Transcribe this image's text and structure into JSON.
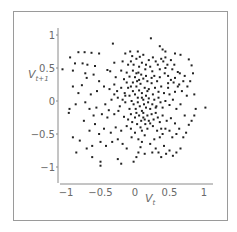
{
  "chart_data": {
    "type": "scatter",
    "title": "",
    "xlabel": "V_t",
    "ylabel": "V_{t+1}",
    "xlabel_main": "V",
    "xlabel_sub": "t",
    "ylabel_main": "V",
    "ylabel_sub": "t+1",
    "xlim": [
      -1.1,
      1.1
    ],
    "ylim": [
      -1.05,
      1.05
    ],
    "x_ticks": [
      -1,
      -0.5,
      0,
      0.5,
      1
    ],
    "y_ticks": [
      -1,
      -0.5,
      0,
      0.5,
      1
    ],
    "x_tick_labels": [
      "−1",
      "−0.5",
      "0",
      "0.5",
      "1"
    ],
    "y_tick_labels": [
      "−1",
      "−0.5",
      "0",
      "0.5",
      "1"
    ],
    "grid": false,
    "legend": null,
    "marker_color": "#222222",
    "axis_color": "#8a8a8a",
    "points": [
      [
        -0.94,
        0.66
      ],
      [
        -0.82,
        0.74
      ],
      [
        -0.73,
        0.74
      ],
      [
        -0.63,
        0.73
      ],
      [
        -0.52,
        0.72
      ],
      [
        -0.87,
        0.57
      ],
      [
        -0.76,
        0.57
      ],
      [
        -0.9,
        0.46
      ],
      [
        -0.69,
        0.55
      ],
      [
        -0.58,
        0.53
      ],
      [
        -0.32,
        0.87
      ],
      [
        -0.3,
        0.58
      ],
      [
        -0.36,
        0.45
      ],
      [
        -0.14,
        0.72
      ],
      [
        -0.07,
        0.75
      ],
      [
        -0.06,
        0.6
      ],
      [
        -0.02,
        0.55
      ],
      [
        0.04,
        0.75
      ],
      [
        0.07,
        0.67
      ],
      [
        0.12,
        0.7
      ],
      [
        -1.05,
        0.48
      ],
      [
        -0.72,
        0.42
      ],
      [
        -0.7,
        0.35
      ],
      [
        -0.77,
        0.24
      ],
      [
        -0.6,
        0.4
      ],
      [
        -0.52,
        0.3
      ],
      [
        -0.4,
        0.47
      ],
      [
        -0.28,
        0.36
      ],
      [
        -0.2,
        0.46
      ],
      [
        -0.16,
        0.33
      ],
      [
        -0.12,
        0.43
      ],
      [
        -0.08,
        0.37
      ],
      [
        -0.03,
        0.46
      ],
      [
        0.0,
        0.36
      ],
      [
        0.03,
        0.3
      ],
      [
        0.05,
        0.43
      ],
      [
        0.09,
        0.4
      ],
      [
        0.12,
        0.34
      ],
      [
        0.15,
        0.48
      ],
      [
        0.18,
        0.3
      ],
      [
        0.22,
        0.52
      ],
      [
        0.25,
        0.45
      ],
      [
        0.28,
        0.38
      ],
      [
        0.33,
        0.55
      ],
      [
        0.38,
        0.64
      ],
      [
        0.41,
        0.6
      ],
      [
        0.44,
        0.66
      ],
      [
        0.47,
        0.55
      ],
      [
        0.52,
        0.62
      ],
      [
        0.57,
        0.55
      ],
      [
        0.36,
        0.83
      ],
      [
        0.4,
        0.78
      ],
      [
        0.44,
        0.75
      ],
      [
        0.58,
        0.72
      ],
      [
        0.66,
        0.7
      ],
      [
        0.78,
        0.63
      ],
      [
        0.82,
        0.54
      ],
      [
        0.23,
        0.95
      ],
      [
        0.65,
        0.42
      ],
      [
        0.72,
        0.38
      ],
      [
        0.62,
        0.44
      ],
      [
        0.54,
        0.48
      ],
      [
        0.48,
        0.38
      ],
      [
        0.43,
        0.42
      ],
      [
        0.36,
        0.36
      ],
      [
        0.32,
        0.3
      ],
      [
        0.24,
        0.27
      ],
      [
        0.29,
        0.2
      ],
      [
        0.38,
        0.22
      ],
      [
        0.48,
        0.27
      ],
      [
        0.56,
        0.28
      ],
      [
        0.64,
        0.25
      ],
      [
        0.68,
        0.15
      ],
      [
        0.58,
        0.14
      ],
      [
        0.5,
        0.1
      ],
      [
        0.42,
        0.12
      ],
      [
        0.34,
        0.14
      ],
      [
        0.26,
        0.1
      ],
      [
        0.75,
        0.08
      ],
      [
        0.86,
        0.1
      ],
      [
        -0.95,
        -0.12
      ],
      [
        -0.96,
        -0.18
      ],
      [
        -0.86,
        -0.05
      ],
      [
        -0.72,
        -0.02
      ],
      [
        -0.64,
        0.1
      ],
      [
        -0.55,
        0.15
      ],
      [
        -0.45,
        0.22
      ],
      [
        -0.37,
        0.18
      ],
      [
        -0.3,
        0.1
      ],
      [
        -0.43,
        -0.05
      ],
      [
        -0.38,
        -0.14
      ],
      [
        -0.3,
        -0.2
      ],
      [
        -0.22,
        -0.08
      ],
      [
        -0.18,
        0.02
      ],
      [
        -0.15,
        0.12
      ],
      [
        -0.1,
        0.2
      ],
      [
        -0.08,
        0.08
      ],
      [
        -0.05,
        0.0
      ],
      [
        -0.03,
        0.15
      ],
      [
        0.0,
        0.1
      ],
      [
        0.02,
        0.22
      ],
      [
        0.04,
        0.05
      ],
      [
        0.06,
        0.16
      ],
      [
        0.08,
        0.26
      ],
      [
        0.1,
        0.12
      ],
      [
        0.12,
        0.02
      ],
      [
        0.14,
        0.2
      ],
      [
        0.16,
        0.08
      ],
      [
        0.18,
        0.15
      ],
      [
        0.2,
        0.04
      ],
      [
        -0.02,
        -0.05
      ],
      [
        0.01,
        -0.12
      ],
      [
        0.04,
        -0.02
      ],
      [
        0.07,
        -0.08
      ],
      [
        0.1,
        -0.15
      ],
      [
        0.13,
        -0.05
      ],
      [
        0.16,
        -0.1
      ],
      [
        0.19,
        -0.02
      ],
      [
        0.22,
        -0.12
      ],
      [
        0.25,
        -0.05
      ],
      [
        0.28,
        0.02
      ],
      [
        0.31,
        -0.08
      ],
      [
        0.34,
        0.05
      ],
      [
        0.37,
        -0.02
      ],
      [
        0.4,
        -0.1
      ],
      [
        0.44,
        0.0
      ],
      [
        0.5,
        -0.06
      ],
      [
        0.55,
        0.02
      ],
      [
        0.6,
        -0.12
      ],
      [
        0.66,
        -0.05
      ],
      [
        -0.06,
        -0.2
      ],
      [
        -0.1,
        -0.28
      ],
      [
        -0.04,
        -0.32
      ],
      [
        0.0,
        -0.25
      ],
      [
        0.03,
        -0.35
      ],
      [
        0.06,
        -0.22
      ],
      [
        0.09,
        -0.3
      ],
      [
        0.12,
        -0.25
      ],
      [
        0.15,
        -0.35
      ],
      [
        0.18,
        -0.22
      ],
      [
        0.2,
        -0.3
      ],
      [
        0.24,
        -0.2
      ],
      [
        0.27,
        -0.28
      ],
      [
        0.3,
        -0.18
      ],
      [
        0.33,
        -0.25
      ],
      [
        0.36,
        -0.32
      ],
      [
        0.4,
        -0.22
      ],
      [
        0.46,
        -0.3
      ],
      [
        0.52,
        -0.26
      ],
      [
        0.58,
        -0.34
      ],
      [
        -0.14,
        -0.02
      ],
      [
        -0.12,
        0.28
      ],
      [
        -0.2,
        0.2
      ],
      [
        -0.25,
        0.05
      ],
      [
        -0.24,
        -0.15
      ],
      [
        -0.16,
        -0.24
      ],
      [
        -0.12,
        -0.38
      ],
      [
        -0.2,
        -0.45
      ],
      [
        -0.28,
        -0.4
      ],
      [
        -0.35,
        -0.48
      ],
      [
        -0.45,
        -0.42
      ],
      [
        -0.52,
        -0.5
      ],
      [
        -0.58,
        -0.35
      ],
      [
        -0.66,
        -0.45
      ],
      [
        -0.74,
        -0.3
      ],
      [
        -0.8,
        -0.6
      ],
      [
        -0.7,
        -0.72
      ],
      [
        -0.62,
        -0.68
      ],
      [
        -0.5,
        -0.62
      ],
      [
        -0.42,
        -0.68
      ],
      [
        -0.33,
        -0.62
      ],
      [
        -0.25,
        -0.58
      ],
      [
        -0.18,
        -0.65
      ],
      [
        -0.12,
        -0.72
      ],
      [
        -0.05,
        -0.55
      ],
      [
        0.0,
        -0.48
      ],
      [
        0.05,
        -0.58
      ],
      [
        0.1,
        -0.45
      ],
      [
        0.14,
        -0.52
      ],
      [
        0.1,
        -0.62
      ],
      [
        -0.9,
        -0.55
      ],
      [
        -0.85,
        -0.78
      ],
      [
        -0.62,
        -0.85
      ],
      [
        -0.5,
        -0.92
      ],
      [
        -0.5,
        -0.98
      ],
      [
        -0.2,
        -0.95
      ],
      [
        -0.25,
        -0.88
      ],
      [
        0.02,
        -0.85
      ],
      [
        0.05,
        -0.78
      ],
      [
        -0.02,
        -0.92
      ],
      [
        0.08,
        -0.7
      ],
      [
        0.14,
        -0.8
      ],
      [
        0.22,
        -0.65
      ],
      [
        0.28,
        -0.58
      ],
      [
        0.32,
        -0.45
      ],
      [
        0.36,
        -0.55
      ],
      [
        0.4,
        -0.5
      ],
      [
        0.44,
        -0.42
      ],
      [
        0.5,
        -0.45
      ],
      [
        0.54,
        -0.55
      ],
      [
        0.6,
        -0.5
      ],
      [
        0.64,
        -0.42
      ],
      [
        0.7,
        -0.55
      ],
      [
        0.74,
        -0.48
      ],
      [
        0.78,
        -0.36
      ],
      [
        0.82,
        -0.3
      ],
      [
        0.86,
        -0.22
      ],
      [
        0.88,
        -0.12
      ],
      [
        1.02,
        -0.1
      ],
      [
        0.72,
        -0.22
      ],
      [
        0.3,
        -0.72
      ],
      [
        0.34,
        -0.78
      ],
      [
        0.38,
        -0.85
      ],
      [
        0.45,
        -0.8
      ],
      [
        0.5,
        -0.75
      ],
      [
        0.55,
        -0.83
      ],
      [
        0.6,
        -0.78
      ],
      [
        0.42,
        -0.68
      ],
      [
        0.66,
        -0.72
      ],
      [
        0.25,
        -0.78
      ],
      [
        -0.3,
        0.25
      ],
      [
        -0.26,
        0.15
      ],
      [
        -0.34,
        0.02
      ],
      [
        -0.4,
        -0.25
      ],
      [
        -0.48,
        -0.2
      ],
      [
        -0.56,
        -0.1
      ],
      [
        -0.6,
        -0.22
      ],
      [
        -0.66,
        -0.12
      ],
      [
        -0.82,
        0.12
      ],
      [
        -0.9,
        0.22
      ],
      [
        0.06,
        0.52
      ],
      [
        0.1,
        0.58
      ],
      [
        0.16,
        0.55
      ],
      [
        0.2,
        0.62
      ],
      [
        0.26,
        0.66
      ],
      [
        0.3,
        0.6
      ],
      [
        0.02,
        0.64
      ],
      [
        -0.04,
        0.68
      ],
      [
        -0.1,
        0.55
      ],
      [
        -0.18,
        0.6
      ],
      [
        0.08,
        -0.4
      ],
      [
        0.18,
        -0.42
      ],
      [
        0.26,
        -0.38
      ],
      [
        -0.06,
        -0.42
      ],
      [
        -0.08,
        -0.12
      ],
      [
        0.02,
        -0.18
      ],
      [
        0.12,
        -0.18
      ],
      [
        0.22,
        -0.34
      ],
      [
        0.3,
        -0.1
      ],
      [
        0.38,
        -0.42
      ],
      [
        -0.03,
        0.28
      ],
      [
        0.06,
        0.32
      ],
      [
        0.1,
        0.05
      ],
      [
        0.14,
        -0.28
      ],
      [
        0.2,
        0.18
      ],
      [
        0.24,
        0.35
      ],
      [
        0.16,
        0.38
      ],
      [
        0.02,
        0.42
      ],
      [
        -0.06,
        0.22
      ],
      [
        -0.14,
        0.08
      ],
      [
        0.48,
        0.2
      ],
      [
        0.52,
        0.32
      ],
      [
        0.58,
        0.35
      ],
      [
        0.62,
        0.22
      ],
      [
        0.7,
        0.3
      ],
      [
        0.76,
        0.22
      ],
      [
        0.8,
        0.3
      ],
      [
        0.84,
        0.42
      ],
      [
        0.44,
        0.5
      ],
      [
        0.36,
        0.48
      ]
    ]
  }
}
